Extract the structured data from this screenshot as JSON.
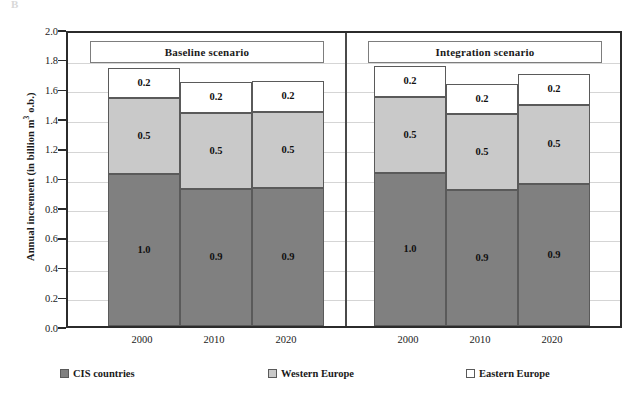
{
  "artifact": {
    "mark": "B"
  },
  "chart_data": {
    "type": "bar",
    "subtype": "stacked-bar",
    "title": "",
    "xlabel": "",
    "ylabel": "Annual increment (in billion m³ o.b.)",
    "ylim": [
      0.0,
      2.0
    ],
    "grid": true,
    "legend_position": "bottom",
    "panels": [
      {
        "name": "Baseline scenario",
        "categories": [
          "2000",
          "2010",
          "2020"
        ],
        "series": [
          {
            "name": "CIS countries",
            "values": [
              1.0,
              0.9,
              0.9
            ],
            "labels": [
              "1.0",
              "0.9",
              "0.9"
            ],
            "color": "#808080"
          },
          {
            "name": "Western Europe",
            "values": [
              0.5,
              0.5,
              0.5
            ],
            "labels": [
              "0.5",
              "0.5",
              "0.5"
            ],
            "color": "#c9c9c9"
          },
          {
            "name": "Eastern Europe",
            "values": [
              0.2,
              0.2,
              0.2
            ],
            "labels": [
              "0.2",
              "0.2",
              "0.2"
            ],
            "color": "#ffffff"
          }
        ],
        "totals": [
          1.74,
          1.64,
          1.65
        ]
      },
      {
        "name": "Integration scenario",
        "categories": [
          "2000",
          "2010",
          "2020"
        ],
        "series": [
          {
            "name": "CIS countries",
            "values": [
              1.0,
              0.9,
              0.9
            ],
            "labels": [
              "1.0",
              "0.9",
              "0.9"
            ],
            "color": "#808080"
          },
          {
            "name": "Western Europe",
            "values": [
              0.5,
              0.5,
              0.5
            ],
            "labels": [
              "0.5",
              "0.5",
              "0.5"
            ],
            "color": "#c9c9c9"
          },
          {
            "name": "Eastern Europe",
            "values": [
              0.2,
              0.2,
              0.2
            ],
            "labels": [
              "0.2",
              "0.2",
              "0.2"
            ],
            "color": "#ffffff"
          }
        ],
        "totals": [
          1.75,
          1.63,
          1.7
        ]
      }
    ],
    "yticks": [
      "2.0",
      "1.8",
      "1.6",
      "1.4",
      "1.2",
      "1.0",
      "0.8",
      "0.6",
      "0.4",
      "0.2",
      "0.0"
    ],
    "legend": [
      {
        "label": "CIS countries",
        "color": "#808080"
      },
      {
        "label": "Western Europe",
        "color": "#c9c9c9"
      },
      {
        "label": "Eastern Europe",
        "color": "#ffffff"
      }
    ]
  },
  "axis": {
    "y_title_main": "Annual increment (in billion m",
    "y_title_sup": "3",
    "y_title_tail": " o.b.)"
  },
  "colors": {
    "cis": "#808080",
    "western": "#c9c9c9",
    "eastern": "#ffffff",
    "frame": "#2b2b2b",
    "grid": "#d5d5d5"
  }
}
